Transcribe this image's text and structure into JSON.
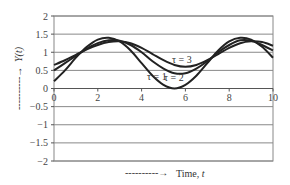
{
  "chart_data": {
    "type": "line",
    "title": "",
    "xlabel": "Time, t",
    "ylabel": "Y(t)",
    "xlim": [
      0,
      10
    ],
    "ylim": [
      -2,
      2
    ],
    "x_ticks": [
      "0",
      "2",
      "4",
      "6",
      "8",
      "10"
    ],
    "y_ticks": [
      "2",
      "1.5",
      "1",
      "0.5",
      "0",
      "−0.5",
      "−1",
      "−1.5",
      "−2"
    ],
    "grid": "horizontal",
    "legend": "inline annotations",
    "annotations": [
      "τ = 1",
      "τ = 2",
      "τ = 3"
    ],
    "x": [
      0,
      0.5,
      1,
      1.5,
      2,
      2.5,
      3,
      3.5,
      4,
      4.5,
      5,
      5.5,
      6,
      6.5,
      7,
      7.5,
      8,
      8.5,
      9,
      9.5,
      10
    ],
    "series": [
      {
        "name": "τ = 1",
        "values": [
          0.2,
          0.5,
          0.85,
          1.15,
          1.35,
          1.4,
          1.3,
          1.05,
          0.7,
          0.35,
          0.1,
          0.0,
          0.1,
          0.35,
          0.7,
          1.05,
          1.3,
          1.4,
          1.35,
          1.15,
          0.85
        ]
      },
      {
        "name": "τ = 2",
        "values": [
          0.5,
          0.7,
          0.9,
          1.1,
          1.25,
          1.33,
          1.32,
          1.2,
          1.0,
          0.75,
          0.55,
          0.42,
          0.42,
          0.55,
          0.75,
          1.0,
          1.2,
          1.33,
          1.32,
          1.2,
          1.05
        ]
      },
      {
        "name": "τ = 3",
        "values": [
          0.65,
          0.78,
          0.93,
          1.08,
          1.2,
          1.28,
          1.3,
          1.25,
          1.12,
          0.95,
          0.78,
          0.65,
          0.6,
          0.65,
          0.78,
          0.95,
          1.12,
          1.25,
          1.3,
          1.28,
          1.18
        ]
      }
    ]
  },
  "labels": {
    "xlabel_arrow": "----------→",
    "xlabel": "Time, t",
    "ylabel": "Y(t)",
    "ylabel_arrow": "----------→"
  }
}
